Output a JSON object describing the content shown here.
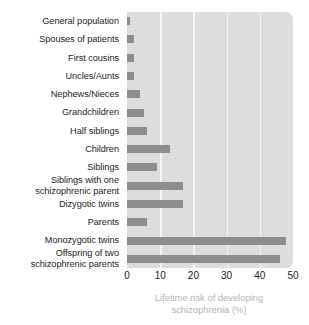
{
  "chart_data": {
    "type": "bar",
    "orientation": "horizontal",
    "title": "",
    "xlabel": "Lifetime risk of developing schizophrenia (%)",
    "xlabel_lines": [
      "Lifetime risk of developing",
      "schizophrenia (%)"
    ],
    "ylabel": "",
    "xlim": [
      0,
      50
    ],
    "xticks": [
      0,
      10,
      20,
      30,
      40,
      50
    ],
    "xtick_labels": [
      "0",
      "10",
      "20",
      "30",
      "40",
      "50"
    ],
    "grid": "vertical",
    "legend": "none",
    "categories": [
      "General population",
      "Spouses of patients",
      "First cousins",
      "Uncles/Aunts",
      "Nephews/Nieces",
      "Grandchildren",
      "Half siblings",
      "Children",
      "Siblings",
      "Siblings with one schizophrenic parent",
      "Dizygotic twins",
      "Parents",
      "Monozygotic twins",
      "Offspring of two schizophrenic parents"
    ],
    "category_lines": [
      [
        "General population"
      ],
      [
        "Spouses of patients"
      ],
      [
        "First cousins"
      ],
      [
        "Uncles/Aunts"
      ],
      [
        "Nephews/Nieces"
      ],
      [
        "Grandchildren"
      ],
      [
        "Half siblings"
      ],
      [
        "Children"
      ],
      [
        "Siblings"
      ],
      [
        "Siblings with one",
        "schizophrenic parent"
      ],
      [
        "Dizygotic twins"
      ],
      [
        "Parents"
      ],
      [
        "Monozygotic twins"
      ],
      [
        "Offspring of two",
        "schizophrenic parents"
      ]
    ],
    "values": [
      1,
      2,
      2,
      2,
      4,
      5,
      6,
      13,
      9,
      17,
      17,
      6,
      48,
      46
    ],
    "colors": {
      "bar": "#8e8e8e",
      "plot_background": "#dddddd",
      "gridline": "#f4f4f4",
      "label_text": "#1d1d1d",
      "axis_title_text": "#b3b3b3",
      "page_background": "#ffffff"
    }
  }
}
